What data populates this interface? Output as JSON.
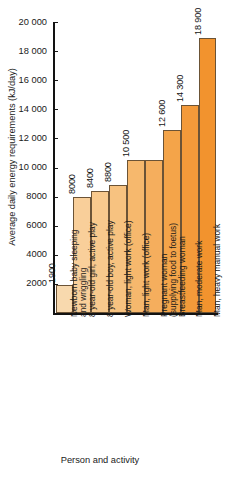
{
  "chart_data": {
    "type": "bar",
    "title": "",
    "xlabel": "Person and activity",
    "ylabel": "Average daily energy requirements (kJ/day)",
    "ylim": [
      0,
      20000
    ],
    "ytick_values": [
      2000,
      4000,
      6000,
      8000,
      10000,
      12000,
      14000,
      16000,
      18000,
      20000
    ],
    "ytick_labels": [
      "2000",
      "4000",
      "6000",
      "8000",
      "10 000",
      "12 000",
      "14 000",
      "16 000",
      "18 000",
      "20 000"
    ],
    "grid": false,
    "legend": null,
    "categories": [
      "Newborn baby sleeping and wriggling",
      "8 year-old girl, active play",
      "8 year-old boy, active play",
      "Woman, light work (office)",
      "Man, light work (office)",
      "Pregnant woman (supplying food to foetus)",
      "Breastfeeding woman",
      "Man, moderate work",
      "Man, heavy manual work"
    ],
    "category_lines": [
      [
        "Newborn baby sleeping",
        "and wriggling"
      ],
      [
        "8 year-old girl, active play"
      ],
      [
        "8 year-old boy, active play"
      ],
      [
        "Woman, light work (office)"
      ],
      [
        "Man, light work (office)"
      ],
      [
        "Pregnant woman",
        "(supplying food to foetus)"
      ],
      [
        "Breastfeeding woman"
      ],
      [
        "Man, moderate work"
      ],
      [
        "Man, heavy manual work"
      ]
    ],
    "values": [
      1900,
      8000,
      8400,
      8800,
      10500,
      10500,
      12600,
      14300,
      18900
    ],
    "value_labels": [
      "1900",
      "8000",
      "8400",
      "8800",
      "10 500",
      "",
      "12 600",
      "14 300",
      "18 900"
    ],
    "bar_colors": [
      "#f8d9ae",
      "#f9cf9a",
      "#f8c98d",
      "#f7c280",
      "#f6b86d",
      "#f5ae5d",
      "#f4a449",
      "#f39a3a",
      "#f2932e"
    ],
    "bar_border_color": "#6b5336",
    "axis_color": "#121212",
    "background": "#ffffff"
  }
}
